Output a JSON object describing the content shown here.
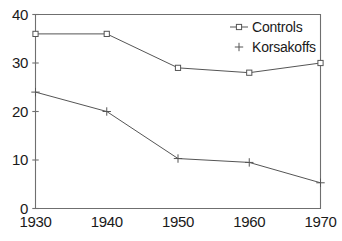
{
  "chart_data": {
    "type": "line",
    "title": "",
    "xlabel": "",
    "ylabel": "",
    "x": [
      1930,
      1940,
      1950,
      1960,
      1970
    ],
    "xtick_labels": [
      "1930",
      "1940",
      "1950",
      "1960",
      "1970"
    ],
    "ytick_labels": [
      "40",
      "30",
      "20",
      "10",
      "0"
    ],
    "yticks": [
      40,
      30,
      20,
      10,
      0
    ],
    "ylim": [
      0,
      40
    ],
    "xlim": [
      1930,
      1970
    ],
    "grid": false,
    "legend_position": "top-right",
    "series": [
      {
        "name": "Controls",
        "marker": "open-square",
        "color": "#555555",
        "values": [
          36,
          36,
          29,
          28,
          30
        ]
      },
      {
        "name": "Korsakoffs",
        "marker": "plus",
        "color": "#555555",
        "values": [
          24,
          20,
          10.3,
          9.5,
          5.3
        ]
      }
    ]
  },
  "legend": {
    "entries": [
      {
        "label": "Controls",
        "marker": "open-square-with-line"
      },
      {
        "label": "Korsakoffs",
        "marker": "plus"
      }
    ]
  },
  "axes": {
    "frame_color": "#6f6f6f",
    "line_color": "#5a5a5a"
  }
}
